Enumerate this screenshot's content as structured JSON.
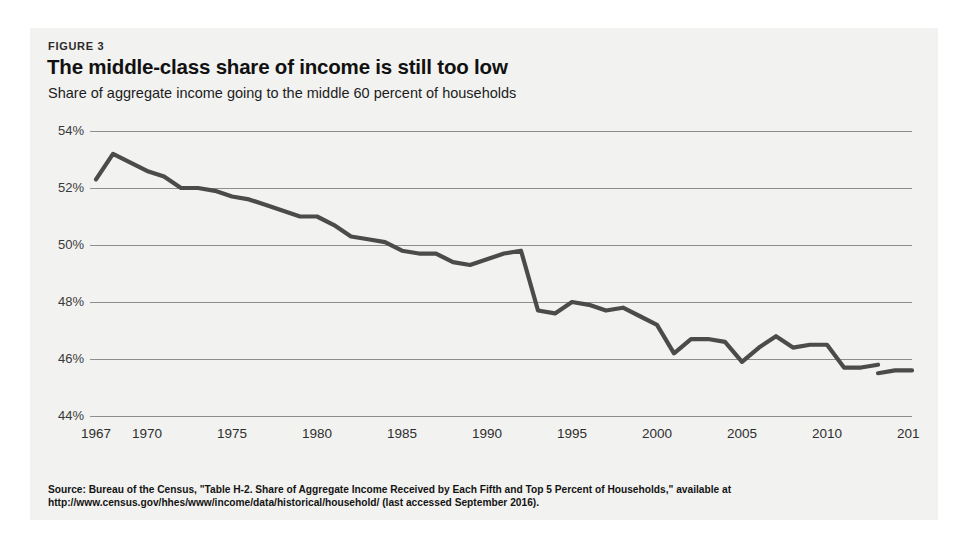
{
  "figure": {
    "label": "FIGURE 3",
    "title": "The middle-class share of income is still too low",
    "subtitle": "Share of aggregate income going to the middle 60 percent of households",
    "panel_bg": "#f2f2f0"
  },
  "source": {
    "line1": "Source: Bureau of the Census, \"Table H-2. Share of Aggregate Income Received by Each Fifth and Top 5 Percent of Households,\" available at",
    "line2": "http://www.census.gov/hhes/www/income/data/historical/household/ (last accessed September 2016)."
  },
  "chart_data": {
    "type": "line",
    "title": "The middle-class share of income is still too low",
    "subtitle": "Share of aggregate income going to the middle 60 percent of households",
    "xlabel": "",
    "ylabel": "",
    "ylim": [
      44,
      54
    ],
    "xlim": [
      1967,
      2015
    ],
    "grid": true,
    "legend": false,
    "line_color": "#4b4b4b",
    "y_ticks": [
      44,
      46,
      48,
      50,
      52,
      54
    ],
    "y_tick_labels": [
      "44%",
      "46%",
      "48%",
      "50%",
      "52%",
      "54%"
    ],
    "x_ticks": [
      1967,
      1970,
      1975,
      1980,
      1985,
      1990,
      1995,
      2000,
      2005,
      2010,
      2015
    ],
    "x_tick_labels": [
      "1967",
      "1970",
      "1975",
      "1980",
      "1985",
      "1990",
      "1995",
      "2000",
      "2005",
      "2010",
      "2015"
    ],
    "series": [
      {
        "name": "Share of aggregate income to middle 60 percent",
        "x": [
          1967,
          1968,
          1969,
          1970,
          1971,
          1972,
          1973,
          1974,
          1975,
          1976,
          1977,
          1978,
          1979,
          1980,
          1981,
          1982,
          1983,
          1984,
          1985,
          1986,
          1987,
          1988,
          1989,
          1990,
          1991,
          1992,
          1993,
          1994,
          1995,
          1996,
          1997,
          1998,
          1999,
          2000,
          2001,
          2002,
          2003,
          2004,
          2005,
          2006,
          2007,
          2008,
          2009,
          2010,
          2011,
          2012,
          2013
        ],
        "values": [
          52.3,
          53.2,
          52.9,
          52.6,
          52.4,
          52.0,
          52.0,
          51.9,
          51.7,
          51.6,
          51.4,
          51.2,
          51.0,
          51.0,
          50.7,
          50.3,
          50.2,
          50.1,
          49.8,
          49.7,
          49.7,
          49.4,
          49.3,
          49.5,
          49.7,
          49.8,
          47.7,
          47.6,
          48.0,
          47.9,
          47.7,
          47.8,
          47.5,
          47.2,
          46.2,
          46.7,
          46.7,
          46.6,
          45.9,
          46.4,
          46.8,
          46.4,
          46.5,
          46.5,
          45.7,
          45.7,
          45.8
        ],
        "values_note": "Pre-2013 methodology series"
      },
      {
        "name": "Share of aggregate income to middle 60 percent (redesigned survey)",
        "x": [
          2013,
          2014,
          2015
        ],
        "values": [
          45.5,
          45.6,
          45.6
        ],
        "values_note": "Post-2013 redesign series (separate short segment at lower right)"
      }
    ]
  }
}
